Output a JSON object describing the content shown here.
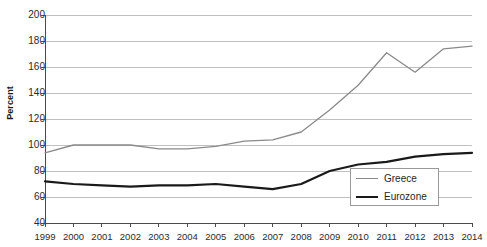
{
  "chart_data": {
    "type": "line",
    "title": "",
    "xlabel": "",
    "ylabel": "Percent",
    "ylim": [
      40,
      200
    ],
    "ytick_step": 20,
    "yticks": [
      40,
      60,
      80,
      100,
      120,
      140,
      160,
      180,
      200
    ],
    "grid": true,
    "legend_position": "bottom-right",
    "x": [
      1999,
      2000,
      2001,
      2002,
      2003,
      2004,
      2005,
      2006,
      2007,
      2008,
      2009,
      2010,
      2011,
      2012,
      2013,
      2014
    ],
    "categories": [
      "1999",
      "2000",
      "2001",
      "2002",
      "2003",
      "2004",
      "2005",
      "2006",
      "2007",
      "2008",
      "2009",
      "2010",
      "2011",
      "2012",
      "2013",
      "2014"
    ],
    "series": [
      {
        "name": "Greece",
        "color": "#8a8a8a",
        "width": 1.3,
        "values": [
          94,
          100,
          100,
          100,
          97,
          97,
          99,
          103,
          104,
          110,
          127,
          146,
          171,
          156,
          174,
          176
        ]
      },
      {
        "name": "Eurozone",
        "color": "#1a1a1a",
        "width": 2.2,
        "values": [
          72,
          70,
          69,
          68,
          69,
          69,
          70,
          68,
          66,
          70,
          80,
          85,
          87,
          91,
          93,
          94
        ]
      }
    ]
  },
  "legend": {
    "items": [
      {
        "label": "Greece"
      },
      {
        "label": "Eurozone"
      }
    ]
  },
  "axis": {
    "y_label": "Percent",
    "y_ticks": [
      "200",
      "180",
      "160",
      "140",
      "120",
      "100",
      "80",
      "60",
      "40"
    ],
    "x_ticks": [
      "1999",
      "2000",
      "2001",
      "2002",
      "2003",
      "2004",
      "2005",
      "2006",
      "2007",
      "2008",
      "2009",
      "2010",
      "2011",
      "2012",
      "2013",
      "2014"
    ]
  },
  "colors": {
    "greece_line": "#8a8a8a",
    "eurozone_line": "#1a1a1a",
    "gridline": "#b9b9b9",
    "axis": "#4a4a4a",
    "background": "#ffffff"
  }
}
